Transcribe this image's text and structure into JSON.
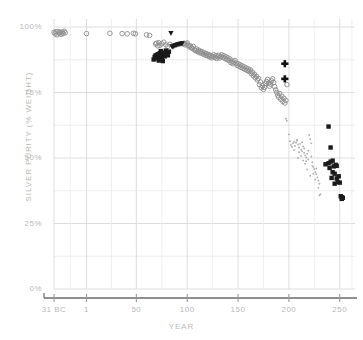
{
  "chart_data": {
    "type": "scatter",
    "title": "",
    "xlabel": "YEAR",
    "ylabel": "SILVER PURITY (% WEIGHT)",
    "xlim": [
      -31,
      265
    ],
    "ylim": [
      0,
      100
    ],
    "grid": true,
    "legend": "none",
    "x_ticks": [
      "31 BC",
      "1",
      "50",
      "100",
      "150",
      "200",
      "250"
    ],
    "x_tick_values": [
      -31,
      1,
      50,
      100,
      150,
      200,
      250
    ],
    "y_ticks": [
      "0%",
      "25%",
      "50%",
      "75%",
      "100%"
    ],
    "y_tick_values": [
      0,
      25,
      50,
      75,
      100
    ],
    "y_minor_gridlines": [
      12.5,
      37.5,
      62.5,
      87.5
    ],
    "series": [
      {
        "name": "open-circle-gray",
        "marker": "open-circle",
        "color": "#8c8c8c",
        "points": [
          [
            -31,
            98.0
          ],
          [
            -30,
            97.4
          ],
          [
            -29,
            98.2
          ],
          [
            -28,
            97.0
          ],
          [
            -27,
            98.3
          ],
          [
            -26,
            97.6
          ],
          [
            -25,
            98.0
          ],
          [
            -24,
            97.2
          ],
          [
            -23,
            98.1
          ],
          [
            -22,
            97.5
          ],
          [
            -21,
            98.4
          ],
          [
            -20,
            97.8
          ],
          [
            1,
            97.5
          ],
          [
            24,
            97.6
          ],
          [
            36,
            97.5
          ],
          [
            41,
            97.4
          ],
          [
            47,
            97.6
          ],
          [
            49,
            97.4
          ],
          [
            60,
            97.0
          ],
          [
            63,
            96.8
          ],
          [
            69,
            93.5
          ],
          [
            70,
            93.8
          ],
          [
            71,
            92.8
          ],
          [
            72,
            94.0
          ],
          [
            73,
            93.0
          ],
          [
            75,
            93.6
          ],
          [
            77,
            94.2
          ],
          [
            79,
            93.2
          ],
          [
            81,
            92.6
          ],
          [
            83,
            93.4
          ],
          [
            96,
            93.6
          ],
          [
            97,
            93.8
          ],
          [
            98,
            93.2
          ],
          [
            99,
            93.5
          ],
          [
            100,
            93.9
          ],
          [
            101,
            93.0
          ],
          [
            102,
            92.4
          ],
          [
            103,
            92.8
          ],
          [
            104,
            92.2
          ],
          [
            105,
            91.8
          ],
          [
            106,
            92.6
          ],
          [
            107,
            91.4
          ],
          [
            108,
            91.0
          ],
          [
            109,
            91.6
          ],
          [
            110,
            90.6
          ],
          [
            111,
            91.2
          ],
          [
            112,
            90.2
          ],
          [
            113,
            90.8
          ],
          [
            114,
            90.0
          ],
          [
            115,
            90.5
          ],
          [
            116,
            89.6
          ],
          [
            117,
            90.1
          ],
          [
            118,
            89.2
          ],
          [
            119,
            89.8
          ],
          [
            120,
            89.0
          ],
          [
            121,
            89.5
          ],
          [
            122,
            88.6
          ],
          [
            123,
            89.1
          ],
          [
            124,
            88.2
          ],
          [
            125,
            88.8
          ],
          [
            126,
            89.4
          ],
          [
            127,
            88.4
          ],
          [
            128,
            89.0
          ],
          [
            129,
            88.0
          ],
          [
            130,
            88.6
          ],
          [
            131,
            89.2
          ],
          [
            132,
            88.2
          ],
          [
            133,
            88.8
          ],
          [
            134,
            89.4
          ],
          [
            135,
            88.4
          ],
          [
            136,
            89.0
          ],
          [
            137,
            88.0
          ],
          [
            138,
            88.6
          ],
          [
            139,
            87.6
          ],
          [
            140,
            88.2
          ],
          [
            141,
            87.2
          ],
          [
            142,
            87.8
          ],
          [
            143,
            86.4
          ],
          [
            144,
            87.0
          ],
          [
            145,
            86.0
          ],
          [
            146,
            86.6
          ],
          [
            147,
            87.2
          ],
          [
            148,
            86.2
          ],
          [
            149,
            85.4
          ],
          [
            150,
            86.0
          ],
          [
            151,
            85.0
          ],
          [
            152,
            85.6
          ],
          [
            153,
            84.6
          ],
          [
            154,
            85.2
          ],
          [
            155,
            84.2
          ],
          [
            156,
            84.8
          ],
          [
            157,
            83.8
          ],
          [
            158,
            84.4
          ],
          [
            159,
            83.4
          ],
          [
            160,
            84.0
          ],
          [
            161,
            83.0
          ],
          [
            162,
            83.6
          ],
          [
            163,
            82.2
          ],
          [
            164,
            82.8
          ],
          [
            165,
            81.4
          ],
          [
            166,
            82.0
          ],
          [
            167,
            80.6
          ],
          [
            168,
            81.2
          ],
          [
            169,
            79.8
          ],
          [
            170,
            80.4
          ],
          [
            171,
            78.0
          ],
          [
            172,
            79.0
          ],
          [
            173,
            76.8
          ],
          [
            174,
            77.6
          ],
          [
            175,
            76.2
          ],
          [
            176,
            77.0
          ],
          [
            177,
            78.4
          ],
          [
            178,
            79.2
          ],
          [
            179,
            80.0
          ],
          [
            180,
            78.6
          ],
          [
            181,
            77.4
          ],
          [
            182,
            78.2
          ],
          [
            183,
            79.4
          ],
          [
            184,
            80.2
          ],
          [
            185,
            78.8
          ],
          [
            186,
            77.2
          ],
          [
            187,
            76.0
          ],
          [
            188,
            75.0
          ],
          [
            189,
            74.0
          ],
          [
            190,
            73.2
          ],
          [
            191,
            74.6
          ],
          [
            192,
            72.4
          ],
          [
            193,
            73.6
          ],
          [
            194,
            71.6
          ],
          [
            195,
            72.8
          ],
          [
            196,
            71.0
          ],
          [
            197,
            72.0
          ],
          [
            198,
            78.0
          ]
        ]
      },
      {
        "name": "small-dot-lightgray",
        "marker": "small-dot",
        "color": "#b0b0b0",
        "points": [
          [
            196,
            77.8
          ],
          [
            197,
            65.0
          ],
          [
            198,
            64.2
          ],
          [
            200,
            59.0
          ],
          [
            201,
            56.4
          ],
          [
            202,
            55.0
          ],
          [
            203,
            54.2
          ],
          [
            204,
            55.6
          ],
          [
            205,
            56.2
          ],
          [
            206,
            54.6
          ],
          [
            207,
            55.8
          ],
          [
            208,
            56.6
          ],
          [
            209,
            55.2
          ],
          [
            210,
            54.0
          ],
          [
            211,
            55.4
          ],
          [
            212,
            53.2
          ],
          [
            213,
            52.6
          ],
          [
            214,
            54.4
          ],
          [
            215,
            52.0
          ],
          [
            216,
            51.0
          ],
          [
            217,
            50.2
          ],
          [
            218,
            51.6
          ],
          [
            219,
            49.4
          ],
          [
            220,
            58.8
          ],
          [
            221,
            57.2
          ],
          [
            222,
            50.6
          ],
          [
            223,
            48.4
          ],
          [
            224,
            46.6
          ],
          [
            225,
            45.8
          ],
          [
            226,
            44.6
          ],
          [
            227,
            43.8
          ],
          [
            228,
            42.6
          ],
          [
            229,
            41.4
          ],
          [
            230,
            40.2
          ],
          [
            231,
            36.2
          ],
          [
            222,
            55.6
          ],
          [
            219,
            52.8
          ],
          [
            213,
            56.0
          ],
          [
            208,
            57.0
          ],
          [
            205,
            53.0
          ],
          [
            212,
            50.8
          ],
          [
            216,
            47.8
          ],
          [
            224,
            44.0
          ],
          [
            226,
            41.8
          ],
          [
            209,
            50.0
          ],
          [
            214,
            49.0
          ],
          [
            218,
            45.6
          ],
          [
            221,
            43.2
          ],
          [
            223,
            47.0
          ],
          [
            210,
            52.2
          ],
          [
            230,
            35.8
          ],
          [
            229,
            38.6
          ],
          [
            227,
            46.0
          ],
          [
            217,
            48.8
          ],
          [
            215,
            53.6
          ]
        ]
      },
      {
        "name": "filled-square-black",
        "marker": "filled-square",
        "color": "#1a1a1a",
        "points": [
          [
            68,
            88.6
          ],
          [
            69,
            89.2
          ],
          [
            70,
            88.0
          ],
          [
            71,
            89.6
          ],
          [
            72,
            88.4
          ],
          [
            73,
            90.0
          ],
          [
            74,
            89.0
          ],
          [
            75,
            88.2
          ],
          [
            76,
            89.4
          ],
          [
            77,
            90.2
          ],
          [
            78,
            88.8
          ],
          [
            79,
            89.8
          ],
          [
            80,
            90.4
          ],
          [
            81,
            89.2
          ],
          [
            82,
            90.6
          ],
          [
            67,
            87.6
          ],
          [
            72,
            87.2
          ],
          [
            76,
            87.0
          ],
          [
            74,
            90.8
          ],
          [
            79,
            91.0
          ],
          [
            239,
            62.0
          ],
          [
            241,
            54.0
          ],
          [
            239,
            48.0
          ],
          [
            241,
            48.6
          ],
          [
            243,
            49.0
          ],
          [
            240,
            46.2
          ],
          [
            244,
            46.8
          ],
          [
            246,
            47.4
          ],
          [
            247,
            47.0
          ],
          [
            243,
            44.6
          ],
          [
            245,
            44.0
          ],
          [
            242,
            42.4
          ],
          [
            247,
            42.2
          ],
          [
            249,
            43.0
          ],
          [
            248,
            40.8
          ],
          [
            250,
            40.6
          ],
          [
            251,
            35.4
          ],
          [
            252,
            35.0
          ],
          [
            252,
            34.4
          ],
          [
            253,
            34.8
          ],
          [
            236,
            47.6
          ],
          [
            245,
            40.2
          ]
        ]
      },
      {
        "name": "filled-triangle-black",
        "marker": "filled-triangle-down",
        "color": "#1a1a1a",
        "points": [
          [
            84,
            97.6
          ],
          [
            85,
            92.6
          ],
          [
            87,
            92.8
          ],
          [
            88,
            93.0
          ],
          [
            90,
            93.2
          ],
          [
            92,
            93.4
          ],
          [
            94,
            93.6
          ],
          [
            86,
            92.4
          ],
          [
            89,
            93.1
          ],
          [
            91,
            93.3
          ],
          [
            93,
            93.5
          ],
          [
            95,
            93.7
          ]
        ]
      },
      {
        "name": "bold-plus-black",
        "marker": "plus",
        "color": "#111111",
        "points": [
          [
            196,
            86.0
          ],
          [
            196,
            80.2
          ]
        ]
      }
    ]
  },
  "axes": {
    "x_axis_line_color": "#6b6b6b",
    "grid_color": "#d6d6d6",
    "tick_text_color": "#b9b9b9"
  }
}
